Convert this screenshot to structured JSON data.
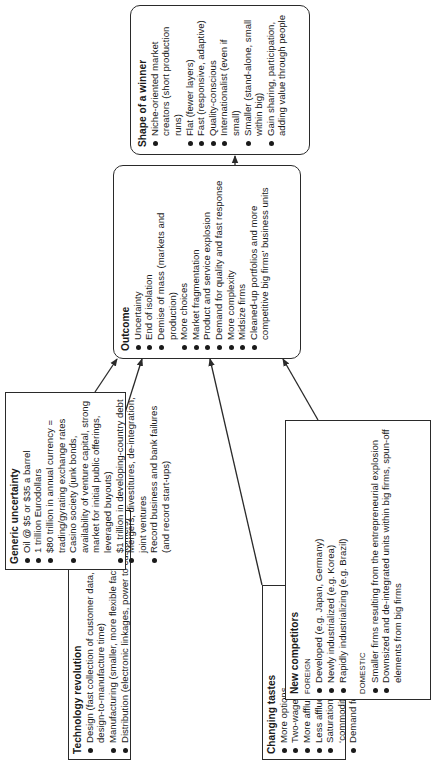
{
  "diagram": {
    "orientation": "rotated 90 degrees counter-clockwise",
    "colors": {
      "line": "#2a2a2a",
      "text": "#1a1a1a",
      "background": "#ffffff"
    },
    "boxes": {
      "technology_revolution": {
        "title": "Technology revolution",
        "items": [
          "Design (fast collection of customer data, reduced design-to-manufacture time)",
          "Manufacturing (smaller, more flexible factories)",
          "Distribution (electronic linkages, power to customers)"
        ]
      },
      "generic_uncertainty": {
        "title": "Generic uncertainty",
        "items": [
          "Oil @ $5 or $35 a barrel",
          "1 trillion Eurodollars",
          "$80 trillion in annual currency = trading/gyrating exchange rates",
          "Casino society (junk bonds, availability of venture capital, strong market for initial public offerings, leveraged buyouts)",
          "$1 trillion in developing-country debt",
          "Mergers, divestitures, de-integration, joint ventures",
          "Record business and bank failures (and record start-ups)"
        ]
      },
      "changing_tastes": {
        "title": "Changing tastes",
        "items": [
          "More options",
          "Two-wage-earner families",
          "More affluence (top third)",
          "Less affluence (bottom third)",
          "Saturation of markets for the ‘commodities’ of yesteryear",
          "Demand for superior quality"
        ]
      },
      "new_competitors": {
        "title": "New competitors",
        "foreign_label": "FOREIGN",
        "foreign_items": [
          "Developed (e.g. Japan, Germany)",
          "Newly industrialized (e.g. Korea)",
          "Rapidly industrializing (e.g. Brazil)"
        ],
        "domestic_label": "DOMESTIC",
        "domestic_items": [
          "Smaller firms resulting from the entrepreneurial explosion",
          "Downsized and de-integrated units within big firms, spun-off elements from big firms"
        ]
      },
      "outcome": {
        "title": "Outcome",
        "items": [
          "Uncertainty",
          "End of isolation",
          "Demise of mass (markets and production)",
          "More choices",
          "Market fragmentation",
          "Product and service explosion",
          "Demand for quality and fast response",
          "More complexity",
          "Midsize firms",
          "Cleaned-up portfolios and more competitive big firms’ business units"
        ]
      },
      "shape_of_a_winner": {
        "title": "Shape of a winner",
        "items": [
          "Niche-oriented market creators (short production runs)",
          "Flat (fewer layers)",
          "Fast (responsive, adaptive)",
          "Quality-conscious",
          "Internationalist (even if small)",
          "Smaller (stand-alone, small within big)",
          "Gain sharing, participation, adding value through people"
        ]
      }
    },
    "arrows": [
      {
        "from": "technology_revolution",
        "to": "outcome"
      },
      {
        "from": "generic_uncertainty",
        "to": "outcome"
      },
      {
        "from": "changing_tastes",
        "to": "outcome"
      },
      {
        "from": "new_competitors",
        "to": "outcome"
      },
      {
        "from": "outcome",
        "to": "shape_of_a_winner"
      }
    ]
  }
}
